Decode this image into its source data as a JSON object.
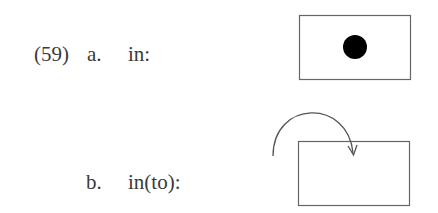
{
  "example": {
    "number": "(59)",
    "items": [
      {
        "label": "a.",
        "term": "in:",
        "figure": "dot-inside-box"
      },
      {
        "label": "b.",
        "term": "in(to):",
        "figure": "arrow-into-box"
      }
    ]
  },
  "colors": {
    "stroke": "#555555",
    "dot": "#000000",
    "text": "#3a3a3a"
  }
}
